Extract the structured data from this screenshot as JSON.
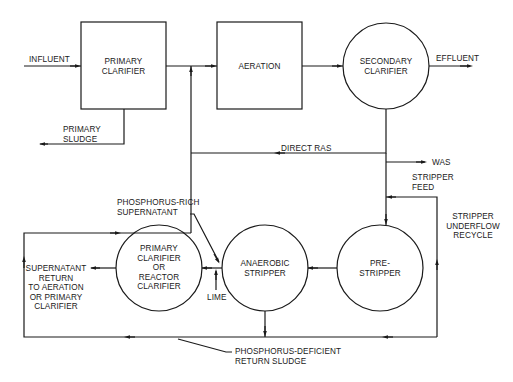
{
  "diagram": {
    "type": "process-flow",
    "title": "",
    "units": {
      "primary_clarifier": {
        "shape": "box",
        "lines": [
          "PRIMARY",
          "CLARIFIER"
        ]
      },
      "aeration": {
        "shape": "box",
        "lines": [
          "AERATION"
        ]
      },
      "secondary_clarifier": {
        "shape": "circle",
        "lines": [
          "SECONDARY",
          "CLARIFIER"
        ]
      },
      "pre_stripper": {
        "shape": "circle",
        "lines": [
          "PRE-",
          "STRIPPER"
        ]
      },
      "anaerobic_stripper": {
        "shape": "circle",
        "lines": [
          "ANAEROBIC",
          "STRIPPER"
        ]
      },
      "reactor_clarifier": {
        "shape": "circle",
        "lines": [
          "PRIMARY",
          "CLARIFIER",
          "OR",
          "REACTOR",
          "CLARIFIER"
        ]
      }
    },
    "streams": {
      "influent": "INFLUENT",
      "effluent": "EFFLUENT",
      "primary_sludge": [
        "PRIMARY",
        "SLUDGE"
      ],
      "direct_ras": "DIRECT RAS",
      "was": "WAS",
      "stripper_feed": [
        "STRIPPER",
        "FEED"
      ],
      "stripper_underflow_recycle": [
        "STRIPPER",
        "UNDERFLOW",
        "RECYCLE"
      ],
      "phosphorus_rich_supernatant": [
        "PHOSPHORUS-RICH",
        "SUPERNATANT"
      ],
      "lime": "LIME",
      "supernatant_return": [
        "SUPERNATANT",
        "RETURN",
        "TO AERATION",
        "OR PRIMARY",
        "CLARIFIER"
      ],
      "phosphorus_deficient_return_sludge": [
        "PHOSPHORUS-DEFICIENT",
        "RETURN SLUDGE"
      ]
    },
    "edges": [
      {
        "from": "influent",
        "to": "primary_clarifier"
      },
      {
        "from": "primary_clarifier",
        "to": "aeration"
      },
      {
        "from": "primary_clarifier",
        "to": "primary_sludge"
      },
      {
        "from": "aeration",
        "to": "secondary_clarifier"
      },
      {
        "from": "secondary_clarifier",
        "to": "effluent"
      },
      {
        "from": "secondary_clarifier",
        "to": "aeration",
        "label": "DIRECT RAS"
      },
      {
        "from": "secondary_clarifier",
        "to": "was"
      },
      {
        "from": "secondary_clarifier",
        "to": "pre_stripper",
        "label": "STRIPPER FEED"
      },
      {
        "from": "pre_stripper",
        "to": "anaerobic_stripper"
      },
      {
        "from": "anaerobic_stripper",
        "to": "reactor_clarifier",
        "label": "PHOSPHORUS-RICH SUPERNATANT"
      },
      {
        "from": "lime",
        "to": "reactor_clarifier"
      },
      {
        "from": "reactor_clarifier",
        "to": "supernatant_return"
      },
      {
        "from": "anaerobic_stripper",
        "to": "aeration",
        "label": "PHOSPHORUS-DEFICIENT RETURN SLUDGE"
      },
      {
        "from": "anaerobic_stripper",
        "to": "pre_stripper",
        "label": "STRIPPER UNDERFLOW RECYCLE"
      }
    ]
  },
  "colors": {
    "line": "#1a1a1a",
    "background": "#ffffff"
  }
}
